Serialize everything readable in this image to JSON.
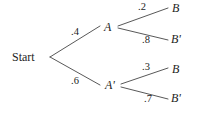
{
  "diagram": {
    "background_color": "#ffffff",
    "line_color": "#3a3a3a",
    "text_color": "#1d1d1d",
    "root": {
      "label": "Start",
      "x": 12,
      "y": 51
    },
    "nodes": [
      {
        "id": "A",
        "label": "A",
        "x": 104,
        "y": 21
      },
      {
        "id": "Ap",
        "label": "A'",
        "x": 105,
        "y": 79
      },
      {
        "id": "B1",
        "label": "B",
        "x": 172,
        "y": 2
      },
      {
        "id": "Bp1",
        "label": "B'",
        "x": 171,
        "y": 33
      },
      {
        "id": "B2",
        "label": "B",
        "x": 172,
        "y": 63
      },
      {
        "id": "Bp2",
        "label": "B'",
        "x": 171,
        "y": 92
      }
    ],
    "edges": [
      {
        "from": "Start",
        "to": "A",
        "probability": ".4",
        "x1": 50,
        "y1": 57,
        "x2": 100,
        "y2": 26,
        "label_x": 71,
        "label_y": 27
      },
      {
        "from": "Start",
        "to": "A'",
        "probability": ".6",
        "x1": 50,
        "y1": 57,
        "x2": 100,
        "y2": 85,
        "label_x": 71,
        "label_y": 76
      },
      {
        "from": "A",
        "to": "B",
        "probability": ".2",
        "x1": 118,
        "y1": 26,
        "x2": 168,
        "y2": 8,
        "label_x": 138,
        "label_y": 2
      },
      {
        "from": "A",
        "to": "B'",
        "probability": ".8",
        "x1": 118,
        "y1": 28,
        "x2": 168,
        "y2": 40,
        "label_x": 142,
        "label_y": 35
      },
      {
        "from": "A'",
        "to": "B",
        "probability": ".3",
        "x1": 121,
        "y1": 84,
        "x2": 168,
        "y2": 68,
        "label_x": 142,
        "label_y": 62
      },
      {
        "from": "A'",
        "to": "B'",
        "probability": ".7",
        "x1": 121,
        "y1": 87,
        "x2": 168,
        "y2": 99,
        "label_x": 144,
        "label_y": 94
      }
    ]
  }
}
